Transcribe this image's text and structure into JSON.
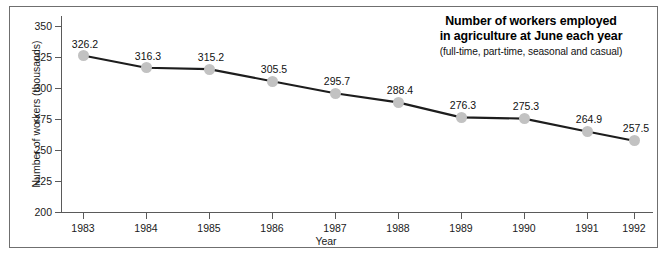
{
  "chart_data": {
    "type": "line",
    "title": "Number of workers employed in agriculture at June each year",
    "title_line1": "Number of workers employed",
    "title_line2": "in agriculture at June each year",
    "subtitle": "(full-time, part-time, seasonal and casual)",
    "xlabel": "Year",
    "ylabel": "Number of workers (thousands)",
    "categories": [
      "1983",
      "1984",
      "1985",
      "1986",
      "1987",
      "1988",
      "1989",
      "1990",
      "1991",
      "1992"
    ],
    "values": [
      326.2,
      316.3,
      315.2,
      305.5,
      295.7,
      288.4,
      276.3,
      275.3,
      264.9,
      257.5
    ],
    "point_labels": [
      "326.2",
      "316.3",
      "315.2",
      "305.5",
      "295.7",
      "288.4",
      "276.3",
      "275.3",
      "264.9",
      "257.5"
    ],
    "ylim": [
      200,
      350
    ],
    "yticks": [
      350,
      325,
      300,
      275,
      250,
      225,
      200
    ],
    "ytick_labels": [
      "350",
      "325",
      "300",
      "275",
      "250",
      "225",
      "200"
    ],
    "grid": false,
    "legend": "none",
    "marker_color": "#c2c2c2",
    "line_color": "#1d1d1d",
    "axis_color": "#5a5a5a",
    "text_color": "#111111",
    "background": "#ffffff"
  }
}
